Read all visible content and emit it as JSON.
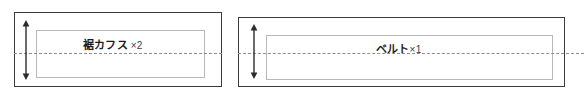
{
  "diagram": {
    "type": "sewing-pattern-layout",
    "background_color": "#ffffff",
    "outline_color": "#3a3a3a",
    "piece_outline_color": "#b8b8b8",
    "fold_line_color": "#8d8d8d",
    "panels": [
      {
        "id": "panel-left",
        "piece_name": "裾カフス",
        "quantity_label": "×2",
        "fold_line": "dashed",
        "dimension_arrow": "vertical-double-headed"
      },
      {
        "id": "panel-right",
        "piece_name": "ベルト",
        "quantity_label": "×1",
        "fold_line": "dashed",
        "dimension_arrow": "vertical-double-headed"
      }
    ]
  }
}
